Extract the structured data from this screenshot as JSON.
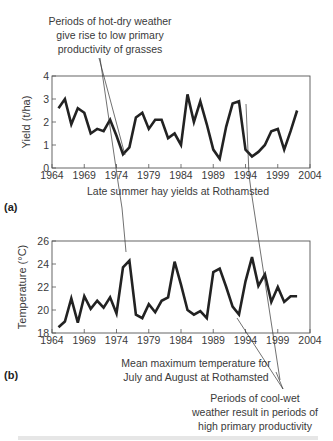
{
  "annotations": {
    "hot_dry": [
      "Periods of hot-dry weather",
      "give rise to low primary",
      "productivity of grasses"
    ],
    "cool_wet": [
      "Periods of cool-wet",
      "weather result in periods of",
      "high primary productivity"
    ]
  },
  "panel_a": {
    "label": "(a)",
    "caption": "Late summer hay yields at Rothamsted"
  },
  "panel_b": {
    "label": "(b)",
    "caption": [
      "Mean maximum temperature for",
      "July and August at Rothamsted"
    ]
  },
  "chart_data": [
    {
      "type": "line",
      "title": "Late summer hay yields at Rothamsted",
      "xlabel": "",
      "ylabel": "Yield (t/ha)",
      "xlim": [
        1964,
        2004
      ],
      "ylim": [
        0,
        4
      ],
      "xticks": [
        "1964",
        "1969",
        "1974",
        "1979",
        "1984",
        "1989",
        "1994",
        "1999",
        "2004"
      ],
      "yticks": [
        "0",
        "1",
        "2",
        "3",
        "4"
      ],
      "grid": false,
      "x": [
        1965,
        1966,
        1967,
        1968,
        1969,
        1970,
        1971,
        1972,
        1973,
        1974,
        1975,
        1976,
        1977,
        1978,
        1979,
        1980,
        1981,
        1982,
        1983,
        1984,
        1985,
        1986,
        1987,
        1988,
        1989,
        1990,
        1991,
        1992,
        1993,
        1994,
        1995,
        1996,
        1997,
        1998,
        1999,
        2000,
        2001,
        2002
      ],
      "series": [
        {
          "name": "Yield",
          "values": [
            2.6,
            3.0,
            1.9,
            2.6,
            2.4,
            1.5,
            1.7,
            1.6,
            2.1,
            1.4,
            0.6,
            0.9,
            2.2,
            2.4,
            1.7,
            2.1,
            2.1,
            1.3,
            1.5,
            1.0,
            3.2,
            2.0,
            2.9,
            1.9,
            0.8,
            0.4,
            1.8,
            2.8,
            2.9,
            0.8,
            0.5,
            0.7,
            1.0,
            1.6,
            1.7,
            0.8,
            1.6,
            2.5
          ]
        }
      ]
    },
    {
      "type": "line",
      "title": "Mean maximum temperature for July and August at Rothamsted",
      "xlabel": "",
      "ylabel": "Temperature (°C)",
      "xlim": [
        1964,
        2004
      ],
      "ylim": [
        18,
        26
      ],
      "xticks": [
        "1964",
        "1969",
        "1974",
        "1979",
        "1984",
        "1989",
        "1994",
        "1999",
        "2004"
      ],
      "yticks": [
        "18",
        "20",
        "22",
        "24",
        "26"
      ],
      "grid": false,
      "x": [
        1965,
        1966,
        1967,
        1968,
        1969,
        1970,
        1971,
        1972,
        1973,
        1974,
        1975,
        1976,
        1977,
        1978,
        1979,
        1980,
        1981,
        1982,
        1983,
        1984,
        1985,
        1986,
        1987,
        1988,
        1989,
        1990,
        1991,
        1992,
        1993,
        1994,
        1995,
        1996,
        1997,
        1998,
        1999,
        2000,
        2001,
        2002
      ],
      "series": [
        {
          "name": "Temperature",
          "values": [
            18.5,
            19.0,
            21.0,
            18.9,
            21.2,
            20.1,
            20.8,
            20.2,
            21.1,
            19.7,
            23.7,
            24.3,
            19.6,
            19.3,
            20.5,
            19.8,
            20.8,
            21.1,
            24.2,
            22.2,
            20.0,
            19.6,
            19.9,
            19.3,
            23.3,
            23.6,
            22.0,
            20.3,
            19.6,
            22.5,
            24.6,
            22.1,
            23.1,
            20.7,
            22.0,
            20.7,
            21.2,
            21.2
          ]
        }
      ]
    }
  ]
}
